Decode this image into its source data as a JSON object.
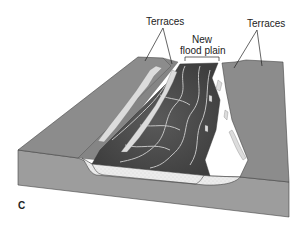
{
  "figure": {
    "panel_letter": "C",
    "labels": {
      "terraces_left": "Terraces",
      "terraces_right": "Terraces",
      "new_flood_plain_line1": "New",
      "new_flood_plain_line2": "flood plain"
    }
  },
  "colors": {
    "terrace_surface": "#8a8a8a",
    "block_side": "#9a9a9a",
    "flood_plain_dark": "#4a4a4a",
    "sediment_fill": "#e8e8e8",
    "outline": "#333333"
  }
}
